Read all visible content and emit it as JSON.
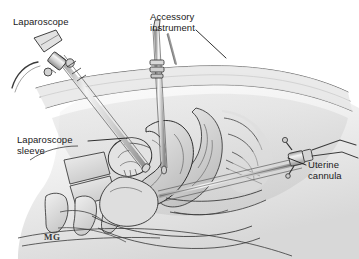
{
  "figure": {
    "background_color": "#ffffff",
    "ink_color": "#2b2b2b",
    "shade_light": "#e9e9e9",
    "shade_mid": "#cfcfcf",
    "shade_dark": "#b0b0b0",
    "width": 359,
    "height": 259
  },
  "labels": {
    "laparoscope": "Laparoscope",
    "accessory_instrument": "Accessory\ninstrument",
    "laparoscope_sleeve": "Laparoscope\nsleeve",
    "uterine_cannula": "Uterine\ncannula"
  },
  "signature": {
    "monogram": "MG"
  },
  "structures": [
    {
      "name": "abdominal-wall",
      "label": "Anterior abdominal wall"
    },
    {
      "name": "uterus",
      "label": "Uterus"
    },
    {
      "name": "bladder",
      "label": "Bladder"
    },
    {
      "name": "rectum",
      "label": "Rectum"
    },
    {
      "name": "sacrum",
      "label": "Sacral vertebrae"
    },
    {
      "name": "vagina",
      "label": "Vagina"
    },
    {
      "name": "ovary",
      "label": "Ovary"
    },
    {
      "name": "pubic-symphysis",
      "label": "Pubic symphysis"
    }
  ],
  "instruments": [
    {
      "name": "laparoscope",
      "label": "Laparoscope",
      "entry": "left lower abdomen, oblique"
    },
    {
      "name": "laparoscope-sleeve",
      "label": "Laparoscope sleeve",
      "entry": "within laparoscope tract"
    },
    {
      "name": "accessory-instrument",
      "label": "Accessory instrument",
      "entry": "midline suprapubic, vertical"
    },
    {
      "name": "uterine-cannula",
      "label": "Uterine cannula",
      "entry": "transvaginal, from lower right"
    }
  ]
}
